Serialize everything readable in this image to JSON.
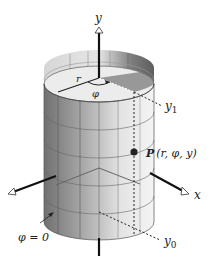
{
  "diagram": {
    "labels": {
      "y_axis": "y",
      "x_axis": "x",
      "r": "r",
      "phi": "φ",
      "y1": "y",
      "y1_sub": "1",
      "y0": "y",
      "y0_sub": "0",
      "point_name": "P",
      "point_coords": "(r, φ, y)",
      "phi_zero": "φ = 0"
    },
    "colors": {
      "axis": "#111111",
      "cylinder_dark": "#7a7a7a",
      "cylinder_light": "#ececec",
      "inner_wall": "#6e6e6e",
      "top_disc": "#e8e8e8",
      "point": "#222222",
      "dashed": "#222222"
    }
  }
}
